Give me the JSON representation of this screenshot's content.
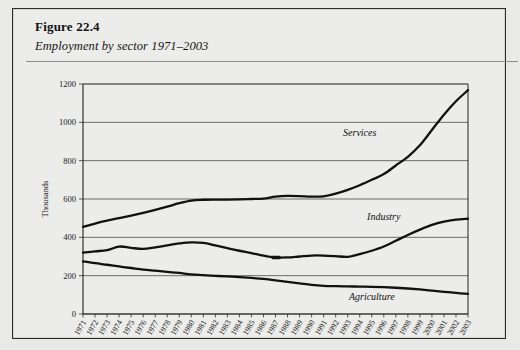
{
  "figure": {
    "number": "Figure 22.4",
    "caption": "Employment by sector 1971–2003"
  },
  "chart_data": {
    "type": "line",
    "title": "Employment by sector 1971–2003",
    "xlabel": "",
    "ylabel": "Thousands",
    "ylim": [
      0,
      1200
    ],
    "yticks": [
      0,
      200,
      400,
      600,
      800,
      1000,
      1200
    ],
    "grid": true,
    "legend_position": "inline-annotations",
    "categories": [
      "1971",
      "1972",
      "1973",
      "1974",
      "1975",
      "1976",
      "1977",
      "1978",
      "1979",
      "1980",
      "1981",
      "1982",
      "1983",
      "1984",
      "1985",
      "1986",
      "1987",
      "1988",
      "1989",
      "1990",
      "1991",
      "1992",
      "1993",
      "1994",
      "1995",
      "1996",
      "1997",
      "1998",
      "1999",
      "2000",
      "2001",
      "2002",
      "2003"
    ],
    "series": [
      {
        "name": "Services",
        "values": [
          455,
          472,
          487,
          500,
          513,
          527,
          543,
          560,
          578,
          592,
          596,
          597,
          597,
          598,
          600,
          602,
          612,
          616,
          615,
          612,
          614,
          628,
          648,
          672,
          700,
          730,
          775,
          820,
          880,
          960,
          1040,
          1110,
          1168
        ]
      },
      {
        "name": "Industry",
        "values": [
          320,
          327,
          333,
          352,
          345,
          340,
          348,
          358,
          368,
          374,
          371,
          358,
          344,
          330,
          318,
          304,
          295,
          295,
          300,
          305,
          305,
          302,
          298,
          312,
          330,
          352,
          382,
          412,
          440,
          465,
          482,
          492,
          497
        ]
      },
      {
        "name": "Agriculture",
        "values": [
          275,
          265,
          257,
          248,
          240,
          232,
          226,
          220,
          214,
          207,
          203,
          199,
          196,
          192,
          188,
          183,
          176,
          168,
          160,
          152,
          147,
          145,
          144,
          143,
          142,
          140,
          137,
          133,
          128,
          122,
          116,
          110,
          105
        ]
      }
    ],
    "annotations": [
      {
        "text": "Services",
        "x_year": "1994",
        "y_value": 930
      },
      {
        "text": "Industry",
        "x_year": "1996",
        "y_value": 490
      },
      {
        "text": "Agriculture",
        "x_year": "1995",
        "y_value": 72
      }
    ]
  }
}
